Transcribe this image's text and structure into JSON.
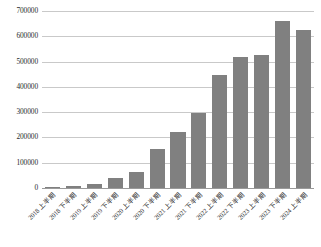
{
  "chart_data": {
    "type": "bar",
    "title": "",
    "xlabel": "",
    "ylabel": "",
    "ylim": [
      0,
      700000
    ],
    "grid": true,
    "legend": "none",
    "bar_color": "#808080",
    "gridline_color": "#c9c9c9",
    "yticks": [
      "0",
      "100000",
      "200000",
      "300000",
      "400000",
      "500000",
      "600000",
      "700000"
    ],
    "ytick_values": [
      0,
      100000,
      200000,
      300000,
      400000,
      500000,
      600000,
      700000
    ],
    "categories": [
      "2018 上半期",
      "2018 下半期",
      "2019 上半期",
      "2019 下半期",
      "2020 上半期",
      "2020 下半期",
      "2021 上半期",
      "2021 下半期",
      "2022 上半期",
      "2022 下半期",
      "2023 上半期",
      "2023 下半期",
      "2024 上半期"
    ],
    "values": [
      5000,
      8000,
      15000,
      38000,
      65000,
      155000,
      222000,
      298000,
      448000,
      518000,
      528000,
      660000,
      625000
    ]
  }
}
